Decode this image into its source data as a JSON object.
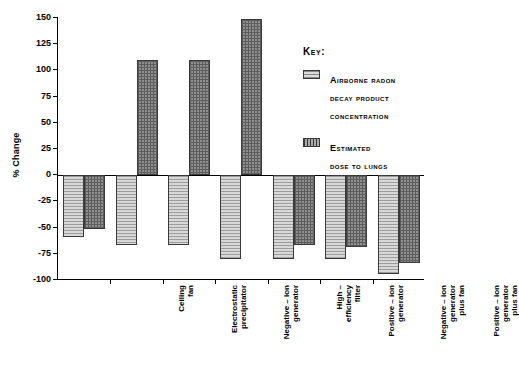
{
  "chart_data": {
    "type": "bar",
    "title": "",
    "xlabel": "",
    "ylabel": "% Change",
    "ylim": [
      -100,
      150
    ],
    "yticks": [
      150,
      125,
      100,
      75,
      50,
      25,
      0,
      -25,
      -50,
      -75,
      -100
    ],
    "ytick_labels": [
      "150",
      "125",
      "100",
      "75",
      "50",
      "25",
      "0",
      "-25",
      "-50",
      "-75",
      "-100"
    ],
    "grid": false,
    "legend_position": "upper-right",
    "categories": [
      "Ceiling\nfan",
      "Electrostatic\nprecipitator",
      "Negative – ion\ngenerator",
      "High –\nefficiency\nfilter",
      "Positive – ion\ngenerator",
      "Negative – ion\ngenerator\nplus fan",
      "Positive – ion\ngenerator\nplus fan"
    ],
    "series": [
      {
        "name": "Airborne radon\ndecay product\nconcentration",
        "pattern": "horizontal-hatch",
        "color": "#c9c9c9",
        "values": [
          -59,
          -67,
          -67,
          -80,
          -80,
          -80,
          -94
        ]
      },
      {
        "name": "Estimated\ndose to lungs",
        "pattern": "cross-hatch",
        "color": "#8f8f8f",
        "values": [
          -51,
          110,
          110,
          149,
          -67,
          -69,
          -84
        ]
      }
    ]
  },
  "legend": {
    "title": "Key:"
  }
}
